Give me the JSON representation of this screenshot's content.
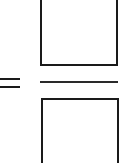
{
  "expression": {
    "operator": "=",
    "fraction": {
      "numerator": "",
      "denominator": ""
    }
  },
  "colors": {
    "stroke": "#1a1a1a",
    "background": "#ffffff"
  }
}
